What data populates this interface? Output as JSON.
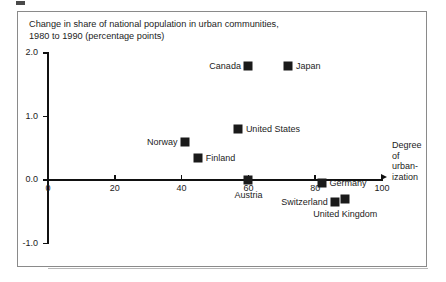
{
  "figure": {
    "title": "Change in share of national population in urban communities,\n1980 to 1990 (percentage points)",
    "x_axis_title": "Degree\nof\nurban-\nization"
  },
  "chart_data": {
    "type": "scatter",
    "title": "Change in share of national population in urban communities, 1980 to 1990 (percentage points)",
    "xlabel": "Degree of urbanization",
    "ylabel": "Change in share of national population in urban communities, 1980 to 1990 (percentage points)",
    "xlim": [
      0,
      100
    ],
    "ylim": [
      -1.0,
      2.0
    ],
    "xticks": [
      "0",
      "20",
      "40",
      "60",
      "80",
      "100"
    ],
    "xtick_values": [
      0,
      20,
      40,
      60,
      80,
      100
    ],
    "yticks": [
      "2.0",
      "1.0",
      "0.0",
      "-1.0"
    ],
    "ytick_values": [
      2.0,
      1.0,
      0.0,
      -1.0
    ],
    "grid": false,
    "legend": false,
    "marker": "filled-square",
    "marker_color": "#1a1a1a",
    "points": [
      {
        "name": "Canada",
        "x": 60,
        "y": 1.8,
        "label_pos": "left"
      },
      {
        "name": "Japan",
        "x": 72,
        "y": 1.8,
        "label_pos": "right"
      },
      {
        "name": "United States",
        "x": 57,
        "y": 0.8,
        "label_pos": "right"
      },
      {
        "name": "Norway",
        "x": 41,
        "y": 0.6,
        "label_pos": "left"
      },
      {
        "name": "Finland",
        "x": 45,
        "y": 0.35,
        "label_pos": "right"
      },
      {
        "name": "Austria",
        "x": 60,
        "y": 0.0,
        "label_pos": "below"
      },
      {
        "name": "Germany",
        "x": 82,
        "y": -0.05,
        "label_pos": "right"
      },
      {
        "name": "Switzerland",
        "x": 86,
        "y": -0.35,
        "label_pos": "left"
      },
      {
        "name": "United Kingdom",
        "x": 89,
        "y": -0.3,
        "label_pos": "below"
      }
    ]
  }
}
